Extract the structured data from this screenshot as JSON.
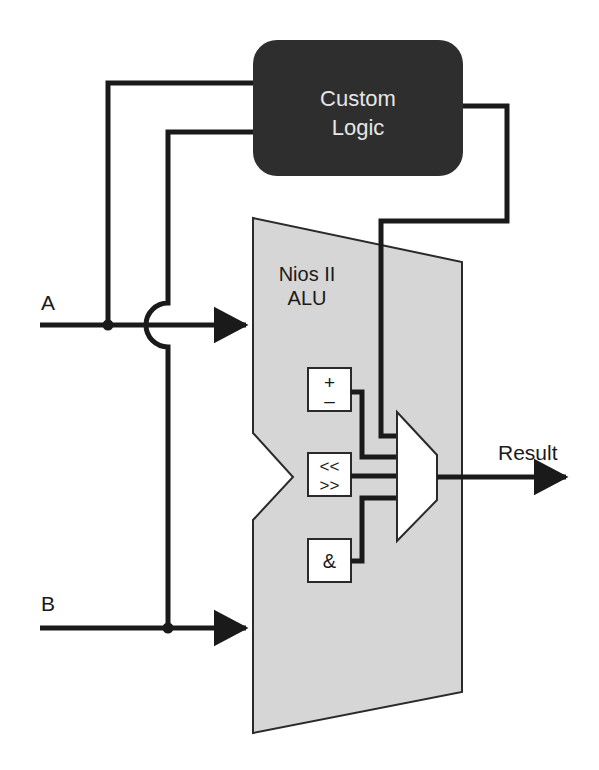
{
  "diagram": {
    "colors": {
      "background": "#ffffff",
      "custom_logic_fill": "#2e2e2e",
      "custom_logic_text": "#e6e6e6",
      "alu_fill": "#d6d6d6",
      "alu_stroke": "#2a2a2a",
      "wire": "#1a1a1a",
      "box_fill": "#ffffff",
      "text": "#1a1a1a"
    },
    "custom_logic": {
      "line1": "Custom",
      "line2": "Logic"
    },
    "alu": {
      "line1": "Nios II",
      "line2": "ALU"
    },
    "inputs": {
      "a_label": "A",
      "b_label": "B"
    },
    "operations": [
      {
        "id": "add-sub",
        "line1": "+",
        "line2": "–"
      },
      {
        "id": "shift",
        "line1": "<<",
        "line2": ">>"
      },
      {
        "id": "and",
        "line1": "&"
      }
    ],
    "mux": {
      "label": ""
    },
    "output": {
      "label": "Result"
    }
  }
}
